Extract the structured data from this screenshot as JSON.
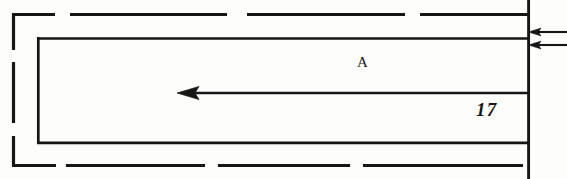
{
  "figure": {
    "kind": "technical-line-drawing",
    "background_color": "#fdfdfc",
    "line_color": "#161616",
    "width": 567,
    "height": 179
  },
  "labels": {
    "region_label": "A",
    "dimension_label": "17"
  },
  "geometry": {
    "outer_dashed_boundary": {
      "name": "outer-dashed-boundary",
      "stroke_width": 3,
      "dash_pattern": "long-dash",
      "left": 12,
      "top": 14,
      "right": 528,
      "bottom": 166
    },
    "inner_solid_rectangle": {
      "name": "inner-solid-rectangle",
      "stroke_width": 2.6,
      "left": 37,
      "top": 38,
      "right": 528,
      "bottom": 143
    },
    "divider_line": {
      "name": "divider-line",
      "y": 93,
      "from_x": 189,
      "to_x": 528
    },
    "right_vertical_edge": {
      "name": "right-vertical-edge",
      "x": 528,
      "from_y": 0,
      "to_y": 179
    }
  },
  "arrows": {
    "left_pointing_interior": {
      "name": "interior-left-arrow",
      "direction": "left",
      "tip_x": 178,
      "tail_x": 528,
      "y": 93
    },
    "right_leader_upper": {
      "name": "leader-arrow-upper",
      "direction": "left",
      "tip_x": 529,
      "tail_x": 567,
      "y": 32
    },
    "right_leader_lower": {
      "name": "leader-arrow-lower",
      "direction": "left",
      "tip_x": 529,
      "tail_x": 567,
      "y": 45
    }
  }
}
